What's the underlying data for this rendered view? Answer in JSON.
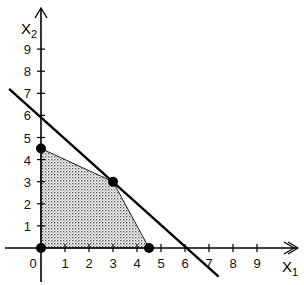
{
  "chart_data": {
    "type": "line",
    "title": "",
    "xlabel": "X1",
    "ylabel": "X2",
    "x_ticks": [
      0,
      1,
      2,
      3,
      4,
      5,
      6,
      7,
      8,
      9
    ],
    "y_ticks": [
      1,
      2,
      3,
      4,
      5,
      6,
      7,
      8,
      9
    ],
    "xlim": [
      -1.5,
      10.7
    ],
    "ylim": [
      -1.7,
      10.3
    ],
    "grid": false,
    "lines": [
      {
        "name": "constraint line x1 + x2 = 6",
        "x": [
          -1.33,
          7.4
        ],
        "y": [
          7.2,
          -1.3
        ]
      }
    ],
    "feasible_region": {
      "fill": "dotted gray",
      "vertices": [
        [
          0,
          0
        ],
        [
          0,
          4.5
        ],
        [
          3,
          3
        ],
        [
          4.5,
          0
        ]
      ]
    },
    "points": [
      {
        "x": 0,
        "y": 0
      },
      {
        "x": 0,
        "y": 4.5
      },
      {
        "x": 3,
        "y": 3
      },
      {
        "x": 4.5,
        "y": 0
      }
    ]
  },
  "labels": {
    "x_axis": "X",
    "x_axis_sub": "1",
    "y_axis": "X",
    "y_axis_sub": "2",
    "origin": "0"
  }
}
